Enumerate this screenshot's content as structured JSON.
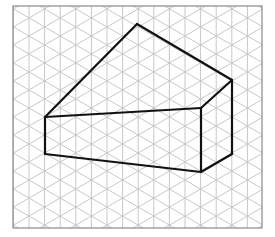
{
  "diagram": {
    "type": "isometric-grid-drawing",
    "colors": {
      "background": "#ffffff",
      "grid_line": "#c8c8c8",
      "border": "#8a8a8a",
      "figure_stroke": "#111111"
    },
    "grid": {
      "left": 13,
      "top": 6,
      "right": 262,
      "bottom": 228,
      "column_spacing": 15.6,
      "first_column_x": 13.4,
      "diagonal_slope": 0.5774
    },
    "figure": {
      "vertices": {
        "front_top_left": [
          45,
          117
        ],
        "front_top_right": [
          201,
          108
        ],
        "front_bottom_left": [
          45,
          154
        ],
        "front_bottom_right": [
          201,
          172
        ],
        "back_top_right": [
          232,
          80
        ],
        "back_bottom_right": [
          232,
          154
        ],
        "apex": [
          137,
          24
        ]
      },
      "edges": [
        [
          "front_top_left",
          "apex"
        ],
        [
          "apex",
          "back_top_right"
        ],
        [
          "front_top_left",
          "front_top_right"
        ],
        [
          "front_top_right",
          "back_top_right"
        ],
        [
          "front_top_left",
          "front_bottom_left"
        ],
        [
          "front_bottom_left",
          "front_bottom_right"
        ],
        [
          "front_top_right",
          "front_bottom_right"
        ],
        [
          "front_bottom_right",
          "back_bottom_right"
        ],
        [
          "back_top_right",
          "back_bottom_right"
        ]
      ],
      "stroke_width": 2.2
    }
  }
}
